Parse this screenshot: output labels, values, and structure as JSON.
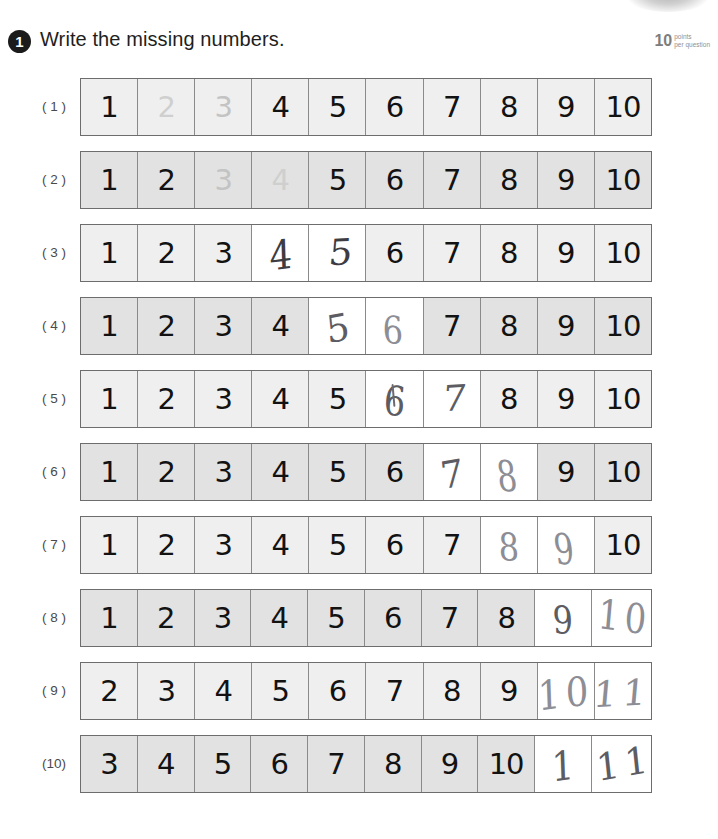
{
  "header": {
    "question_number": "1",
    "title": "Write the missing numbers.",
    "points_value": "10",
    "points_label_line1": "points",
    "points_label_line2": "per question"
  },
  "rows": [
    {
      "label": "( 1 )",
      "shade": "light",
      "cells": [
        {
          "text": "1",
          "state": "printed"
        },
        {
          "text": "2",
          "state": "faded"
        },
        {
          "text": "3",
          "state": "faded"
        },
        {
          "text": "4",
          "state": "printed"
        },
        {
          "text": "5",
          "state": "printed"
        },
        {
          "text": "6",
          "state": "printed"
        },
        {
          "text": "7",
          "state": "printed"
        },
        {
          "text": "8",
          "state": "printed"
        },
        {
          "text": "9",
          "state": "printed"
        },
        {
          "text": "10",
          "state": "printed"
        }
      ]
    },
    {
      "label": "( 2 )",
      "shade": "dark",
      "cells": [
        {
          "text": "1",
          "state": "printed"
        },
        {
          "text": "2",
          "state": "printed"
        },
        {
          "text": "3",
          "state": "faded"
        },
        {
          "text": "4",
          "state": "faded"
        },
        {
          "text": "5",
          "state": "printed"
        },
        {
          "text": "6",
          "state": "printed"
        },
        {
          "text": "7",
          "state": "printed"
        },
        {
          "text": "8",
          "state": "printed"
        },
        {
          "text": "9",
          "state": "printed"
        },
        {
          "text": "10",
          "state": "printed"
        }
      ]
    },
    {
      "label": "( 3 )",
      "shade": "light",
      "cells": [
        {
          "text": "1",
          "state": "printed"
        },
        {
          "text": "2",
          "state": "printed"
        },
        {
          "text": "3",
          "state": "printed"
        },
        {
          "text": "4",
          "state": "handwritten",
          "ink": "dark",
          "style": "hw-1",
          "offset": "hw-offset-a"
        },
        {
          "text": "5",
          "state": "handwritten",
          "ink": "dark",
          "style": "hw-3",
          "offset": "hw-offset-b"
        },
        {
          "text": "6",
          "state": "printed"
        },
        {
          "text": "7",
          "state": "printed"
        },
        {
          "text": "8",
          "state": "printed"
        },
        {
          "text": "9",
          "state": "printed"
        },
        {
          "text": "10",
          "state": "printed"
        }
      ]
    },
    {
      "label": "( 4 )",
      "shade": "dark",
      "cells": [
        {
          "text": "1",
          "state": "printed"
        },
        {
          "text": "2",
          "state": "printed"
        },
        {
          "text": "3",
          "state": "printed"
        },
        {
          "text": "4",
          "state": "printed"
        },
        {
          "text": "5",
          "state": "handwritten",
          "ink": "normal",
          "style": "hw-5",
          "offset": "hw-offset-a"
        },
        {
          "text": "6",
          "state": "handwritten",
          "ink": "light",
          "style": "hw-2",
          "offset": "hw-offset-c"
        },
        {
          "text": "7",
          "state": "printed"
        },
        {
          "text": "8",
          "state": "printed"
        },
        {
          "text": "9",
          "state": "printed"
        },
        {
          "text": "10",
          "state": "printed"
        }
      ]
    },
    {
      "label": "( 5 )",
      "shade": "light",
      "cells": [
        {
          "text": "1",
          "state": "printed"
        },
        {
          "text": "2",
          "state": "printed"
        },
        {
          "text": "3",
          "state": "printed"
        },
        {
          "text": "4",
          "state": "printed"
        },
        {
          "text": "5",
          "state": "printed"
        },
        {
          "text": "6",
          "state": "handwritten",
          "ink": "normal",
          "style": "hw-4",
          "offset": "hw-offset-a",
          "corrected": true
        },
        {
          "text": "7",
          "state": "handwritten",
          "ink": "normal",
          "style": "hw-3",
          "offset": "hw-offset-b"
        },
        {
          "text": "8",
          "state": "printed"
        },
        {
          "text": "9",
          "state": "printed"
        },
        {
          "text": "10",
          "state": "printed"
        }
      ]
    },
    {
      "label": "( 6 )",
      "shade": "dark",
      "cells": [
        {
          "text": "1",
          "state": "printed"
        },
        {
          "text": "2",
          "state": "printed"
        },
        {
          "text": "3",
          "state": "printed"
        },
        {
          "text": "4",
          "state": "printed"
        },
        {
          "text": "5",
          "state": "printed"
        },
        {
          "text": "6",
          "state": "printed"
        },
        {
          "text": "7",
          "state": "handwritten",
          "ink": "normal",
          "style": "hw-5",
          "offset": "hw-offset-a"
        },
        {
          "text": "8",
          "state": "handwritten",
          "ink": "light",
          "style": "hw-6",
          "offset": "hw-offset-c"
        },
        {
          "text": "9",
          "state": "printed"
        },
        {
          "text": "10",
          "state": "printed"
        }
      ]
    },
    {
      "label": "( 7 )",
      "shade": "light",
      "cells": [
        {
          "text": "1",
          "state": "printed"
        },
        {
          "text": "2",
          "state": "printed"
        },
        {
          "text": "3",
          "state": "printed"
        },
        {
          "text": "4",
          "state": "printed"
        },
        {
          "text": "5",
          "state": "printed"
        },
        {
          "text": "6",
          "state": "printed"
        },
        {
          "text": "7",
          "state": "printed"
        },
        {
          "text": "8",
          "state": "handwritten",
          "ink": "light",
          "style": "hw-2",
          "offset": "hw-offset-a"
        },
        {
          "text": "9",
          "state": "handwritten",
          "ink": "light",
          "style": "hw-6",
          "offset": "hw-offset-c"
        },
        {
          "text": "10",
          "state": "printed"
        }
      ]
    },
    {
      "label": "( 8 )",
      "shade": "dark",
      "cells": [
        {
          "text": "1",
          "state": "printed"
        },
        {
          "text": "2",
          "state": "printed"
        },
        {
          "text": "3",
          "state": "printed"
        },
        {
          "text": "4",
          "state": "printed"
        },
        {
          "text": "5",
          "state": "printed"
        },
        {
          "text": "6",
          "state": "printed"
        },
        {
          "text": "7",
          "state": "printed"
        },
        {
          "text": "8",
          "state": "printed"
        },
        {
          "text": "9",
          "state": "handwritten",
          "ink": "normal",
          "style": "hw-2",
          "offset": "hw-offset-a"
        },
        {
          "text": "10",
          "state": "handwritten",
          "ink": "light",
          "style": "hw-4",
          "offset": "hw-offset-b",
          "wide": true
        }
      ]
    },
    {
      "label": "( 9 )",
      "shade": "light",
      "cells": [
        {
          "text": "2",
          "state": "printed"
        },
        {
          "text": "3",
          "state": "printed"
        },
        {
          "text": "4",
          "state": "printed"
        },
        {
          "text": "5",
          "state": "printed"
        },
        {
          "text": "6",
          "state": "printed"
        },
        {
          "text": "7",
          "state": "printed"
        },
        {
          "text": "8",
          "state": "printed"
        },
        {
          "text": "9",
          "state": "printed"
        },
        {
          "text": "10",
          "state": "handwritten",
          "ink": "light",
          "style": "hw-1",
          "offset": "hw-offset-a",
          "wide": true
        },
        {
          "text": "11",
          "state": "handwritten",
          "ink": "light",
          "style": "hw-3",
          "offset": "hw-offset-a",
          "wide": true
        }
      ]
    },
    {
      "label": "(10)",
      "shade": "dark",
      "cells": [
        {
          "text": "3",
          "state": "printed"
        },
        {
          "text": "4",
          "state": "printed"
        },
        {
          "text": "5",
          "state": "printed"
        },
        {
          "text": "6",
          "state": "printed"
        },
        {
          "text": "7",
          "state": "printed"
        },
        {
          "text": "8",
          "state": "printed"
        },
        {
          "text": "9",
          "state": "printed"
        },
        {
          "text": "10",
          "state": "printed"
        },
        {
          "text": "1",
          "state": "handwritten",
          "ink": "normal",
          "style": "hw-1",
          "offset": "hw-offset-a"
        },
        {
          "text": "11",
          "state": "handwritten",
          "ink": "normal",
          "style": "hw-5",
          "offset": "hw-offset-b",
          "wide": true
        }
      ]
    }
  ],
  "colors": {
    "shade_light": "#efefef",
    "shade_dark": "#e2e2e2",
    "blank": "#ffffff",
    "printed_ink": "#121212",
    "faded_ink": "#c7c7c7",
    "pencil_ink": "#5c5c62",
    "border": "#6d6d6d"
  }
}
